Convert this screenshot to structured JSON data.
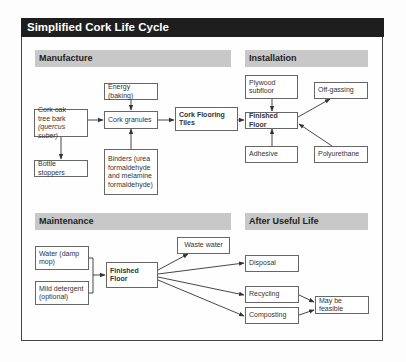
{
  "title": "Simplified Cork Life Cycle",
  "sections": {
    "manufacture": {
      "header": "Manufacture",
      "energy": "Energy (baking)",
      "cork_oak_line1": "Cork oak",
      "cork_oak_line2": "tree bark",
      "cork_oak_line3": "(quercus suber)",
      "cork_granules": "Cork granules",
      "cork_tiles": "Cork Flooring Tiles",
      "bottle_stoppers": "Bottle stoppers",
      "binders": "Binders (urea formaldehyde and melamine formaldehyde)"
    },
    "installation": {
      "header": "Installation",
      "plywood": "Plywood subfloor",
      "off_gassing": "Off-gassing",
      "finished_floor": "Finished Floor",
      "adhesive": "Adhesive",
      "polyurethane": "Polyurethane"
    },
    "maintenance": {
      "header": "Maintenance",
      "water": "Water (damp mop)",
      "detergent": "Mild detergent (optional)",
      "finished_floor": "Finished Floor",
      "waste_water": "Waste water"
    },
    "after_life": {
      "header": "After Useful Life",
      "disposal": "Disposal",
      "recycling": "Recycling",
      "composting": "Composting",
      "feasible": "May be feasible"
    }
  },
  "colors": {
    "title_bg": "#1e1e1e",
    "header_bg": "#c8c8c8",
    "line": "#333333"
  }
}
